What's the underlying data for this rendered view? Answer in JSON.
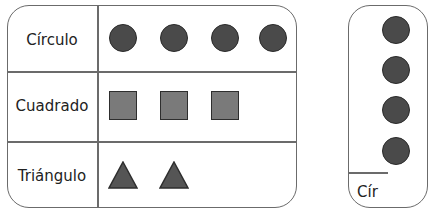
{
  "left_table": {
    "rows": [
      {
        "label": "Círculo",
        "shape": "circle",
        "count": 4
      },
      {
        "label": "Cuadrado",
        "shape": "square",
        "count": 3
      },
      {
        "label": "Triángulo",
        "shape": "triangle",
        "count": 2
      }
    ]
  },
  "right_table": {
    "bottom_label": "Cír",
    "visible_shape": "circle",
    "visible_count": 4
  },
  "colors": {
    "border": "#6b6b6b",
    "circle_fill": "#4a4a4a",
    "square_fill": "#7a7a7a",
    "triangle_fill": "#555555"
  }
}
